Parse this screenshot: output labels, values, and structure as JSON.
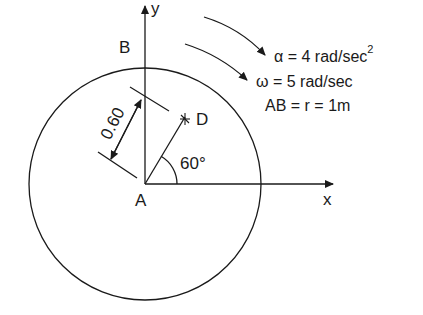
{
  "diagram": {
    "labels": {
      "y_axis": "y",
      "x_axis": "x",
      "point_B": "B",
      "point_A": "A",
      "point_D": "D",
      "dimension": "0.60",
      "angle": "60°"
    },
    "equations": {
      "alpha_symbol": "α",
      "alpha_rest": " = 4 rad/sec",
      "alpha_exp": "2",
      "omega_symbol": "ω",
      "omega_rest": " = 5 rad/sec",
      "radius": "AB = r = 1m"
    },
    "colors": {
      "stroke": "#1a1a1a",
      "background": "#ffffff"
    }
  }
}
